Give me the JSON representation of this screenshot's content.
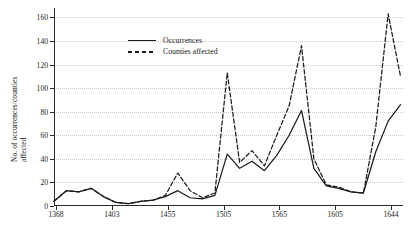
{
  "chart_data": {
    "type": "line",
    "title": "",
    "xlabel": "",
    "ylabel": "No. of occurrences/counties affected",
    "ylabel_line1": "No. of occurrences/counties",
    "ylabel_line2": "affected",
    "ylim": [
      0,
      168
    ],
    "yticks": [
      0,
      20,
      40,
      60,
      80,
      100,
      120,
      140,
      160
    ],
    "ytick_labels": [
      "0",
      "20",
      "40",
      "60",
      "80",
      "100",
      "120",
      "140",
      "160"
    ],
    "grid": true,
    "grid_axis": "y",
    "legend_position": "top-left",
    "xlim": [
      1368,
      1650
    ],
    "xticks": [
      1368,
      1403,
      1455,
      1505,
      1565,
      1605,
      1644
    ],
    "xtick_labels": [
      "1368",
      "1403",
      "1455",
      "1505",
      "1565",
      "1605",
      "1644"
    ],
    "x": [
      1368,
      1378,
      1388,
      1398,
      1408,
      1418,
      1428,
      1438,
      1448,
      1458,
      1468,
      1478,
      1488,
      1498,
      1508,
      1518,
      1528,
      1538,
      1548,
      1558,
      1568,
      1578,
      1588,
      1598,
      1608,
      1618,
      1628,
      1638,
      1648
    ],
    "series": [
      {
        "name": "Occurrences",
        "style": "solid",
        "color": "#1c1c1c",
        "values": [
          4,
          13,
          12,
          15,
          8,
          3,
          2,
          4,
          5,
          8,
          13,
          7,
          6,
          9,
          44,
          32,
          38,
          30,
          43,
          60,
          81,
          32,
          17,
          15,
          12,
          11,
          46,
          72,
          86
        ]
      },
      {
        "name": "Counties affected",
        "style": "dashed",
        "color": "#1c1c1c",
        "values": [
          4,
          13,
          12,
          15,
          8,
          3,
          2,
          4,
          5,
          9,
          28,
          13,
          7,
          11,
          113,
          37,
          47,
          34,
          60,
          85,
          136,
          40,
          18,
          16,
          12,
          11,
          67,
          163,
          110
        ]
      }
    ],
    "annotations": []
  },
  "legend": {
    "items": [
      {
        "label": "Occurrences",
        "key": "solid-line-key"
      },
      {
        "label": "Counties affected",
        "key": "dashed-line-key"
      }
    ]
  }
}
